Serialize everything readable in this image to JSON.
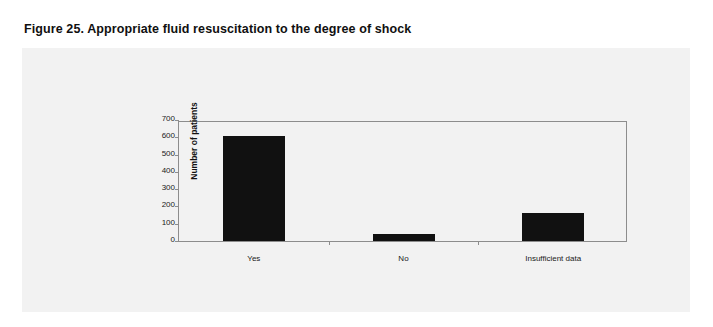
{
  "figure": {
    "title": "Figure 25. Appropriate fluid resuscitation to the degree of shock"
  },
  "colors": {
    "page_background": "#ffffff",
    "panel_background": "#f2f2f2",
    "bar_fill": "#111111",
    "axis_line": "#8d8d8d",
    "text": "#1a1a1a"
  },
  "chart_data": {
    "type": "bar",
    "title": "Figure 25. Appropriate fluid resuscitation to the degree of shock",
    "xlabel": "",
    "ylabel": "Number of patients",
    "categories": [
      "Yes",
      "No",
      "Insufficient data"
    ],
    "values": [
      610,
      40,
      160
    ],
    "ylim": [
      0,
      700
    ],
    "yticks": [
      0,
      100,
      200,
      300,
      400,
      500,
      600,
      700
    ],
    "ytick_labels": [
      "0",
      "100",
      "200",
      "300",
      "400",
      "500",
      "600",
      "700"
    ],
    "grid": false,
    "legend": null,
    "series": [
      {
        "name": "Number of patients",
        "values": [
          610,
          40,
          160
        ]
      }
    ]
  }
}
